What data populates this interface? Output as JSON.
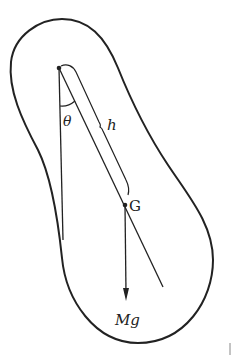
{
  "diagram": {
    "type": "physical-pendulum",
    "labels": {
      "angle": "θ",
      "length": "h",
      "center_of_mass": "G",
      "force": "Mg"
    },
    "colors": {
      "ink": "#222222",
      "background": "#ffffff"
    }
  }
}
